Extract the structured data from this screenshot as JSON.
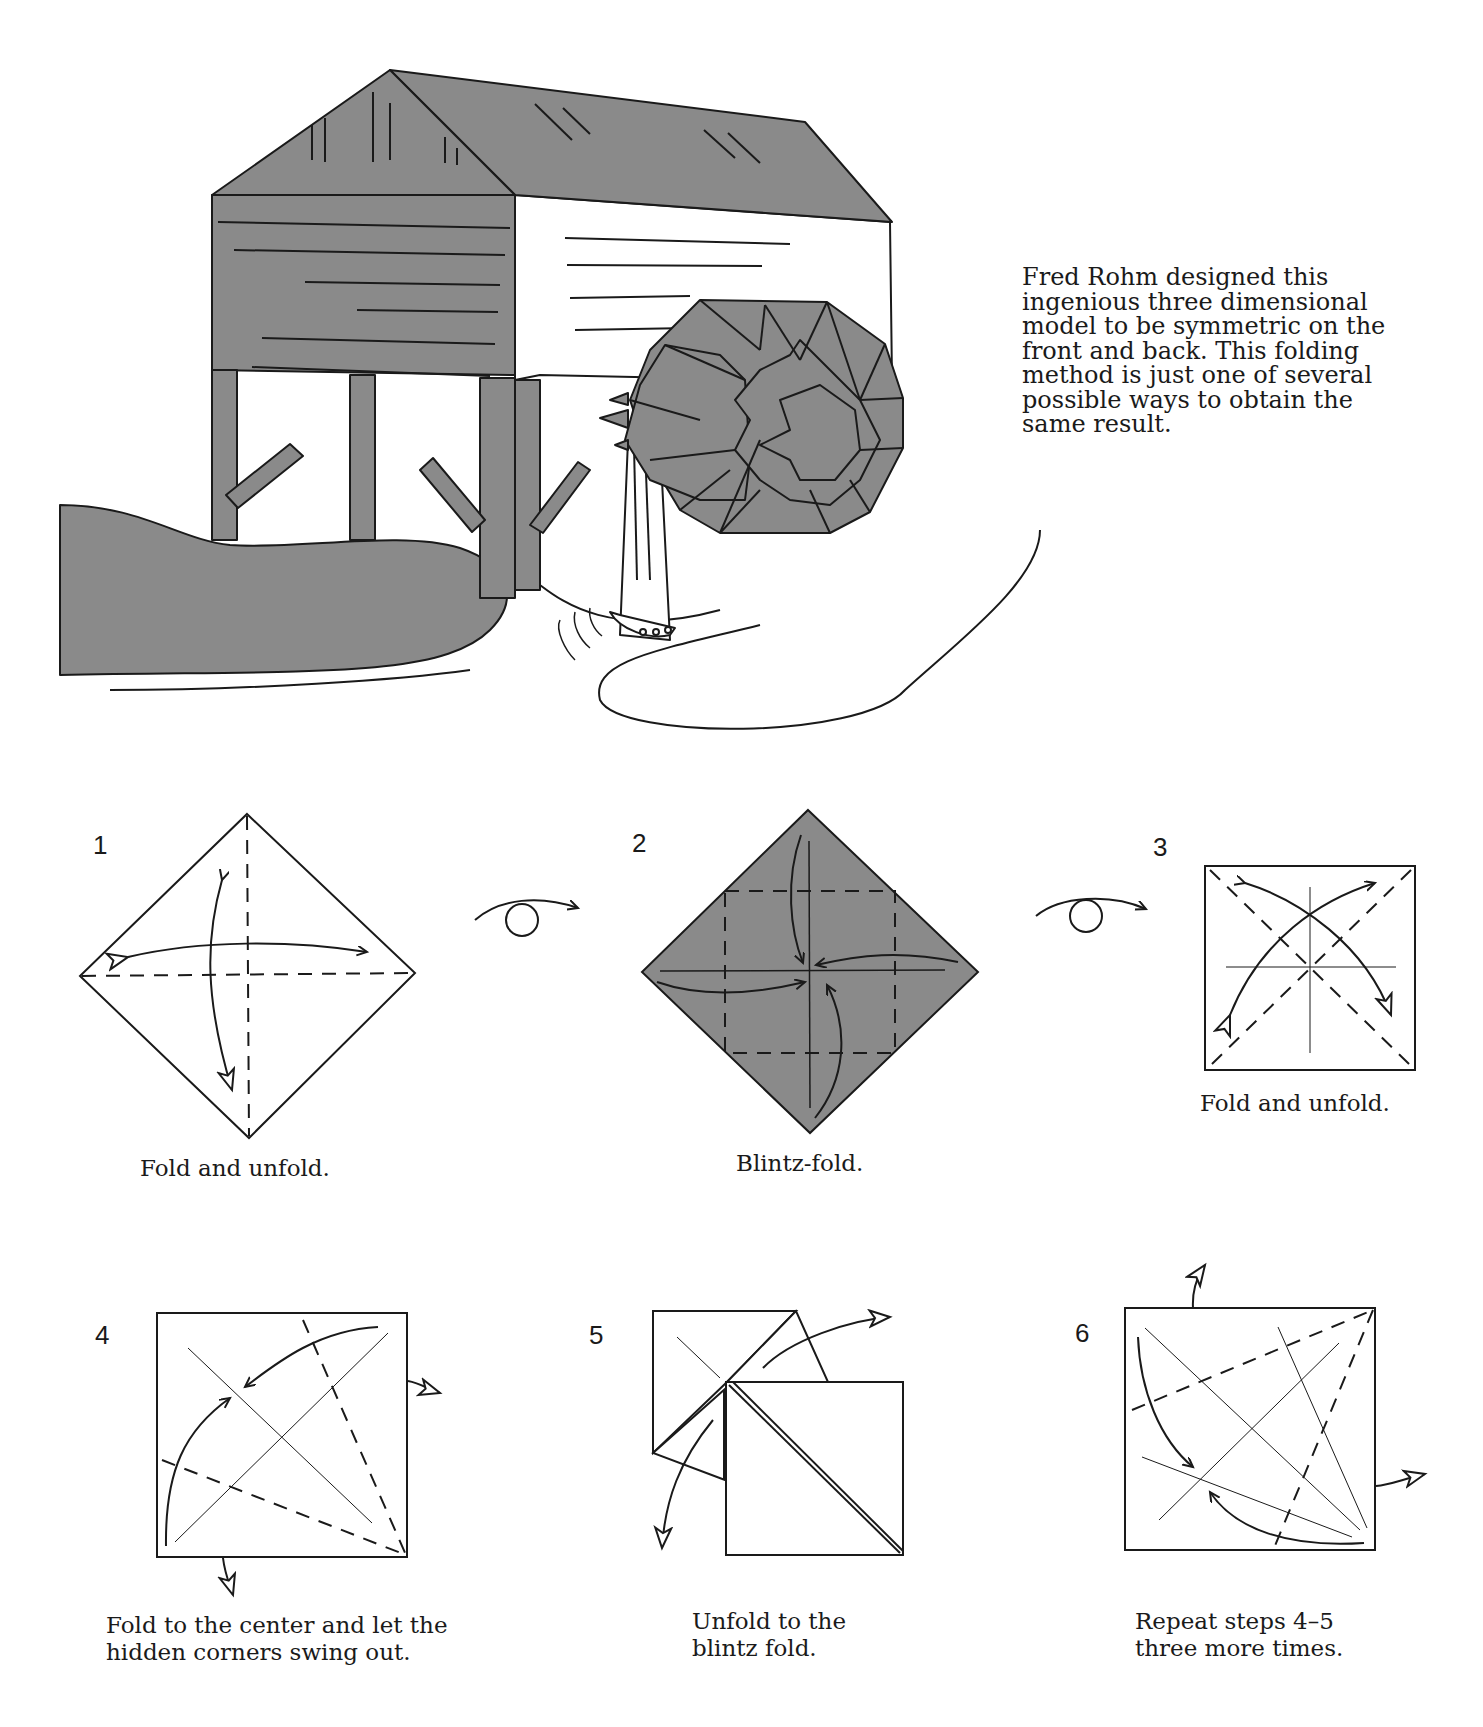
{
  "intro": {
    "lines": [
      "Fred Rohm designed this",
      "ingenious three dimensional",
      "model to be symmetric on the",
      "front and back. This folding",
      "method is just one of several",
      "possible ways to obtain the",
      "same result."
    ]
  },
  "illustration": {
    "subject": "watermill-with-waterwheel",
    "fill_color": "#8a8a8a",
    "line_color": "#1a1a1a"
  },
  "steps": [
    {
      "number": "1",
      "caption_lines": [
        "Fold and unfold."
      ]
    },
    {
      "number": "2",
      "caption_lines": [
        "Blintz-fold."
      ]
    },
    {
      "number": "3",
      "caption_lines": [
        "Fold and unfold."
      ]
    },
    {
      "number": "4",
      "caption_lines": [
        "Fold to the center and let the",
        "hidden corners swing out."
      ]
    },
    {
      "number": "5",
      "caption_lines": [
        "Unfold to the",
        "blintz fold."
      ]
    },
    {
      "number": "6",
      "caption_lines": [
        "Repeat steps 4–5",
        "three more times."
      ]
    }
  ],
  "symbols": {
    "turn_over_1": "turn-over-icon",
    "turn_over_2": "turn-over-icon"
  }
}
